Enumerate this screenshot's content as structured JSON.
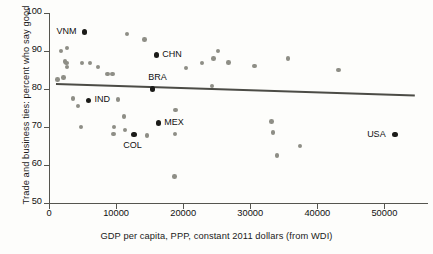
{
  "chart_data": {
    "type": "scatter",
    "title": "",
    "xlabel": "GDP per capita, PPP, constant 2011 dollars (from WDI)",
    "ylabel": "Trade and business ties: percent  who say good",
    "xlim": [
      0,
      56500
    ],
    "ylim": [
      50,
      100
    ],
    "xticks": [
      0,
      10000,
      20000,
      30000,
      40000,
      50000
    ],
    "xtick_labels": [
      "0",
      "10000",
      "20000",
      "30000",
      "40000",
      "50000"
    ],
    "yticks": [
      50,
      60,
      70,
      80,
      90,
      100
    ],
    "ytick_labels": [
      "50",
      "60",
      "70",
      "80",
      "90",
      "100"
    ],
    "grid": false,
    "legend": "none",
    "trendline": {
      "type": "linear",
      "x_start": 1000,
      "y_start": 81.6,
      "x_end": 54500,
      "y_end": 78.6
    },
    "labeled_points": [
      {
        "code": "VNM",
        "x": 5300,
        "y": 95.0,
        "label_side": "left"
      },
      {
        "code": "CHN",
        "x": 16000,
        "y": 89.0,
        "label_side": "right"
      },
      {
        "code": "BRA",
        "x": 15400,
        "y": 80.0,
        "label_side": "above"
      },
      {
        "code": "IND",
        "x": 5900,
        "y": 77.0,
        "label_side": "right"
      },
      {
        "code": "COL",
        "x": 12700,
        "y": 68.0,
        "label_side": "below"
      },
      {
        "code": "MEX",
        "x": 16300,
        "y": 71.0,
        "label_side": "right"
      },
      {
        "code": "USA",
        "x": 51600,
        "y": 68.0,
        "label_side": "left"
      }
    ],
    "unlabeled_points": [
      {
        "x": 1300,
        "y": 82.5
      },
      {
        "x": 1800,
        "y": 90.0
      },
      {
        "x": 2700,
        "y": 90.8
      },
      {
        "x": 2400,
        "y": 87.3
      },
      {
        "x": 2600,
        "y": 86.8
      },
      {
        "x": 2700,
        "y": 85.8
      },
      {
        "x": 2200,
        "y": 83.0
      },
      {
        "x": 4900,
        "y": 86.8
      },
      {
        "x": 6100,
        "y": 86.8
      },
      {
        "x": 7300,
        "y": 85.8
      },
      {
        "x": 8700,
        "y": 84.0
      },
      {
        "x": 9500,
        "y": 84.0
      },
      {
        "x": 11600,
        "y": 94.5
      },
      {
        "x": 14200,
        "y": 93.0
      },
      {
        "x": 3600,
        "y": 77.5
      },
      {
        "x": 4300,
        "y": 75.5
      },
      {
        "x": 4800,
        "y": 70.0
      },
      {
        "x": 9700,
        "y": 70.0
      },
      {
        "x": 9600,
        "y": 68.2
      },
      {
        "x": 10300,
        "y": 77.3
      },
      {
        "x": 11200,
        "y": 72.8
      },
      {
        "x": 11300,
        "y": 69.2
      },
      {
        "x": 14600,
        "y": 67.8
      },
      {
        "x": 18900,
        "y": 74.5
      },
      {
        "x": 18800,
        "y": 68.2
      },
      {
        "x": 18700,
        "y": 57.0
      },
      {
        "x": 20400,
        "y": 85.5
      },
      {
        "x": 22800,
        "y": 86.8
      },
      {
        "x": 24300,
        "y": 80.8
      },
      {
        "x": 24500,
        "y": 88.0
      },
      {
        "x": 25200,
        "y": 90.0
      },
      {
        "x": 26800,
        "y": 87.0
      },
      {
        "x": 30600,
        "y": 86.0
      },
      {
        "x": 33200,
        "y": 71.5
      },
      {
        "x": 33400,
        "y": 68.5
      },
      {
        "x": 34000,
        "y": 62.5
      },
      {
        "x": 35600,
        "y": 88.0
      },
      {
        "x": 37400,
        "y": 65.0
      },
      {
        "x": 43200,
        "y": 85.0
      }
    ]
  }
}
